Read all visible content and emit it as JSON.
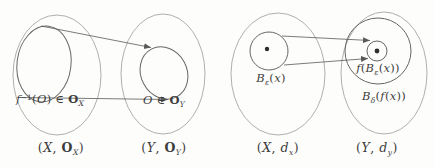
{
  "figure": {
    "bg": "#fdfdfc",
    "outer_stroke": "#a6a6a3",
    "inner_stroke": "#666663",
    "arrow_stroke": "#59595a",
    "dot_fill": "#2e2e2e",
    "text_color": "#3d3d3d"
  },
  "labels": {
    "preimage": [
      [
        "f",
        "it"
      ],
      [
        "−1",
        "sup"
      ],
      [
        "(",
        ""
      ],
      [
        "O",
        "it"
      ],
      [
        ")",
        ""
      ],
      [
        " ∈ ",
        ""
      ],
      [
        "O",
        "frak"
      ],
      [
        "X",
        "sub it"
      ]
    ],
    "open_set": [
      [
        "O",
        "it"
      ],
      [
        " ∈ ",
        ""
      ],
      [
        "O",
        "frak"
      ],
      [
        "Y",
        "sub it"
      ]
    ],
    "eps_ball": [
      [
        "B",
        "it"
      ],
      [
        "ε",
        "sub it"
      ],
      [
        "(",
        ""
      ],
      [
        "x",
        "it"
      ],
      [
        ")",
        ""
      ]
    ],
    "image_ball": [
      [
        "f",
        "it"
      ],
      [
        "(",
        ""
      ],
      [
        "B",
        "it"
      ],
      [
        "ε",
        "sub it"
      ],
      [
        "(",
        ""
      ],
      [
        "x",
        "it"
      ],
      [
        "))",
        ""
      ]
    ],
    "delta_ball": [
      [
        "B",
        "it"
      ],
      [
        "δ",
        "sub it"
      ],
      [
        "(",
        ""
      ],
      [
        "f",
        "it"
      ],
      [
        "(",
        ""
      ],
      [
        "x",
        "it"
      ],
      [
        "))",
        ""
      ]
    ],
    "caption_top_x": [
      [
        "(",
        ""
      ],
      [
        "X",
        "it"
      ],
      [
        ", ",
        ""
      ],
      [
        "O",
        "frak"
      ],
      [
        "X",
        "sub it"
      ],
      [
        ")",
        ""
      ]
    ],
    "caption_top_y": [
      [
        "(",
        ""
      ],
      [
        "Y",
        "it"
      ],
      [
        ", ",
        ""
      ],
      [
        "O",
        "frak"
      ],
      [
        "Y",
        "sub it"
      ],
      [
        ")",
        ""
      ]
    ],
    "caption_met_x": [
      [
        "(",
        ""
      ],
      [
        "X",
        "it"
      ],
      [
        ", ",
        ""
      ],
      [
        "d",
        "it"
      ],
      [
        "x",
        "sub it"
      ],
      [
        ")",
        ""
      ]
    ],
    "caption_met_y": [
      [
        "(",
        ""
      ],
      [
        "Y",
        "it"
      ],
      [
        ", ",
        ""
      ],
      [
        "d",
        "it"
      ],
      [
        "y",
        "sub it"
      ],
      [
        ")",
        ""
      ]
    ]
  }
}
